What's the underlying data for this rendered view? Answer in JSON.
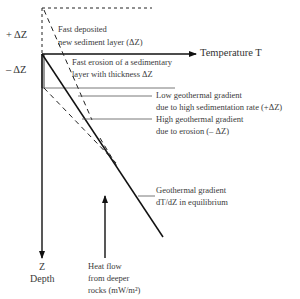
{
  "diagram": {
    "axes": {
      "x_label": "Temperature T",
      "y_label_symbol": "Z",
      "y_label": "Depth"
    },
    "left_markers": {
      "plus": "+ ΔZ",
      "minus": "– ΔZ"
    },
    "annotations": {
      "deposited_line1": "Fast deposited",
      "deposited_line2": "new sediment layer (ΔZ)",
      "erosion_line1": "Fast erosion of a sedimentary",
      "erosion_line2": "layer with thickness ΔZ",
      "low_line1": "Low geothermal gradient",
      "low_line2": "due to high sedimentation rate (+ΔZ)",
      "high_line1": "High geothermal gradient",
      "high_line2": "due to erosion (– ΔZ)",
      "equil_line1": "Geothermal gradient",
      "equil_line2": "dT/dZ in equilibrium",
      "heat_line1": "Heat flow",
      "heat_line2": "from deeper",
      "heat_line3": "rocks (mW/m²)"
    }
  }
}
